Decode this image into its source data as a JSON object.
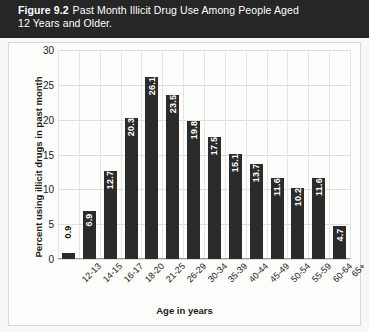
{
  "caption": {
    "figure_number": "Figure 9.2",
    "line1": "Past Month Illicit Drug Use Among People Aged",
    "line2": "12 Years and Older."
  },
  "colors": {
    "bar": "#2b2b2b",
    "banner": "#262626",
    "panel": "#fdfdfc",
    "grid": "#dedede",
    "text": "#1a1a1a",
    "value_text": "#ffffff"
  },
  "chart_data": {
    "type": "bar",
    "title": "Past Month Illicit Drug Use Among People Aged 12 Years and Older.",
    "xlabel": "Age in years",
    "ylabel": "Percent using illicit drugs in past month",
    "categories": [
      "12-13",
      "14-15",
      "16-17",
      "18-20",
      "21-25",
      "26-29",
      "30-34",
      "35-39",
      "40-44",
      "45-49",
      "50-54",
      "55-59",
      "60-64",
      "65+"
    ],
    "values": [
      0.9,
      6.9,
      12.7,
      20.3,
      26.1,
      23.5,
      19.8,
      17.5,
      15.1,
      13.7,
      11.6,
      10.2,
      11.6,
      4.7
    ],
    "value_labels": [
      "0.9",
      "6.9",
      "12.7",
      "20.3",
      "26.1",
      "23.5",
      "19.8",
      "17.5",
      "15.1",
      "13.7",
      "11.6",
      "10.2",
      "11.6",
      "4.7"
    ],
    "ylim": [
      0,
      30
    ],
    "yticks": [
      0,
      5,
      10,
      15,
      20,
      25,
      30
    ],
    "ytick_labels": [
      "0",
      "5",
      "10",
      "15",
      "20",
      "25",
      "30"
    ],
    "grid": true,
    "legend": null
  }
}
